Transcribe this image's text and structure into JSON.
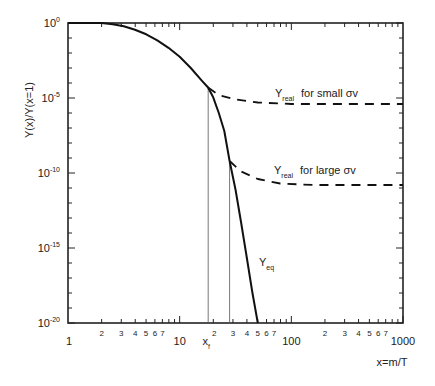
{
  "chart_data": {
    "type": "line",
    "title": "",
    "xlabel": "x=m/T",
    "ylabel": "Y(x)/Y(x=1)",
    "xscale": "log",
    "yscale": "log",
    "xlim": [
      1,
      1000
    ],
    "ylim": [
      1e-20,
      1
    ],
    "grid": false,
    "legend": "inline annotations",
    "x_major_ticks": [
      {
        "value": 1,
        "label": "1"
      },
      {
        "value": 10,
        "label": "10"
      },
      {
        "value": 100,
        "label": "100"
      },
      {
        "value": 1000,
        "label": "1000"
      }
    ],
    "x_minor_tick_labels": [
      "2",
      "3",
      "4",
      "5",
      "6",
      "7"
    ],
    "y_major_ticks": [
      {
        "exp": 0,
        "base": "10",
        "sup": "0"
      },
      {
        "exp": -5,
        "base": "10",
        "sup": "-5"
      },
      {
        "exp": -10,
        "base": "10",
        "sup": "-10"
      },
      {
        "exp": -15,
        "base": "10",
        "sup": "-15"
      },
      {
        "exp": -20,
        "base": "10",
        "sup": "-20"
      }
    ],
    "series": [
      {
        "name": "Y_eq",
        "label_main": "Y",
        "label_sub": "eq",
        "style": "solid",
        "points_log10": [
          [
            0,
            0
          ],
          [
            0.301,
            0
          ],
          [
            0.4,
            -0.08
          ],
          [
            0.5,
            -0.22
          ],
          [
            0.6,
            -0.45
          ],
          [
            0.7,
            -0.75
          ],
          [
            0.8,
            -1.15
          ],
          [
            0.9,
            -1.65
          ],
          [
            1.0,
            -2.25
          ],
          [
            1.1,
            -3.0
          ],
          [
            1.2,
            -3.85
          ],
          [
            1.255,
            -4.3
          ],
          [
            1.3,
            -4.95
          ],
          [
            1.35,
            -6.0
          ],
          [
            1.4,
            -7.2
          ],
          [
            1.447,
            -9.2
          ],
          [
            1.5,
            -11.1
          ],
          [
            1.55,
            -13.3
          ],
          [
            1.6,
            -15.6
          ],
          [
            1.65,
            -17.9
          ],
          [
            1.7,
            -20
          ]
        ]
      },
      {
        "name": "Y_real for small σv",
        "label_main": "Y",
        "label_sub": "real",
        "label_rest": "for small σv",
        "style": "dashed",
        "points_log10": [
          [
            1.255,
            -4.3
          ],
          [
            1.35,
            -4.8
          ],
          [
            1.5,
            -5.1
          ],
          [
            1.7,
            -5.3
          ],
          [
            2.0,
            -5.4
          ],
          [
            2.5,
            -5.4
          ],
          [
            3.0,
            -5.4
          ]
        ]
      },
      {
        "name": "Y_real for large σv",
        "label_main": "Y",
        "label_sub": "real",
        "label_rest": "for large σv",
        "style": "dashed",
        "points_log10": [
          [
            1.447,
            -9.2
          ],
          [
            1.55,
            -9.9
          ],
          [
            1.7,
            -10.4
          ],
          [
            1.9,
            -10.7
          ],
          [
            2.2,
            -10.8
          ],
          [
            2.6,
            -10.8
          ],
          [
            3.0,
            -10.8
          ]
        ]
      }
    ],
    "annotations": [
      {
        "type": "vline",
        "x": 18,
        "label_main": "x",
        "label_sub": "f",
        "y_top_log10": -4.3
      },
      {
        "type": "vline",
        "x": 28,
        "label": "",
        "y_top_log10": -9.2
      }
    ]
  }
}
